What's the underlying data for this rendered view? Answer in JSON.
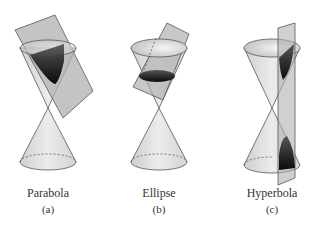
{
  "figures": [
    {
      "name": "Parabola",
      "label": "(a)"
    },
    {
      "name": "Ellipse",
      "label": "(b)"
    },
    {
      "name": "Hyperbola",
      "label": "(c)"
    }
  ],
  "colors": {
    "cone_fill": "#dedede",
    "plane_fill": "#b4b4b4",
    "section_dark": "#1a1a1a",
    "stroke": "#555555"
  }
}
